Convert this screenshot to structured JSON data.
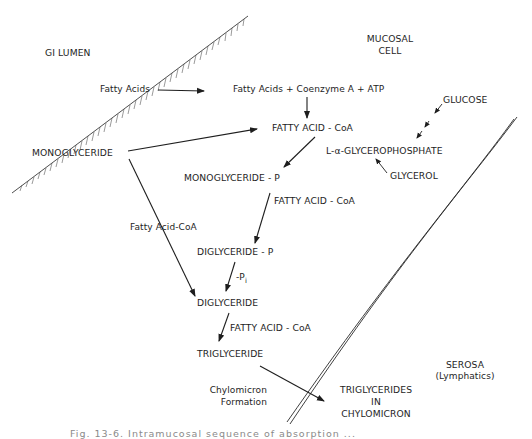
{
  "regions": {
    "gi_lumen": "GI   LUMEN",
    "mucosal_cell": [
      "MUCOSAL",
      "CELL"
    ],
    "serosa": [
      "SEROSA",
      "(Lymphatics)"
    ]
  },
  "nodes": {
    "fatty_acids_lumen": "Fatty Acids",
    "monoglyceride_lumen": "MONOGLYCERIDE",
    "activation": "Fatty Acids  +  Coenzyme A  +  ATP",
    "fatty_acid_coa_1": "FATTY ACID - CoA",
    "glucose": "GLUCOSE",
    "glycerophosphate": "L-α-GLYCEROPHOSPHATE",
    "glycerol": "GLYCEROL",
    "monoglyceride_p": "MONOGLYCERIDE - P",
    "fatty_acid_coa_2": "FATTY ACID - CoA",
    "fatty_acid_coa_side": "Fatty Acid-CoA",
    "diglyceride_p": "DIGLYCERIDE - P",
    "minus_pi": "-P",
    "minus_pi_sub": "i",
    "diglyceride": "DIGLYCERIDE",
    "fatty_acid_coa_3": "FATTY ACID - CoA",
    "triglyceride": "TRIGLYCERIDE",
    "chylomicron_formation": [
      "Chylomicron",
      "Formation"
    ],
    "triglycerides_in_chylomicron": [
      "TRIGLYCERIDES",
      "IN",
      "CHYLOMICRON"
    ]
  },
  "edges": [
    {
      "from": "fatty_acids_lumen",
      "to": "activation"
    },
    {
      "from": "activation",
      "to": "fatty_acid_coa_1"
    },
    {
      "from": "monoglyceride_lumen",
      "to": "fatty_acid_coa_1"
    },
    {
      "from": "fatty_acid_coa_1",
      "to": "monoglyceride_p"
    },
    {
      "from": "glucose",
      "to": "glycerophosphate",
      "style": "dashed"
    },
    {
      "from": "glycerol",
      "to": "glycerophosphate"
    },
    {
      "from": "monoglyceride_p",
      "to": "diglyceride_p",
      "label": "FATTY ACID - CoA"
    },
    {
      "from": "monoglyceride_lumen",
      "to": "diglyceride",
      "label": "Fatty Acid-CoA"
    },
    {
      "from": "diglyceride_p",
      "to": "diglyceride",
      "label": "-Pi"
    },
    {
      "from": "diglyceride",
      "to": "triglyceride",
      "label": "FATTY ACID - CoA"
    },
    {
      "from": "triglyceride",
      "to": "triglycerides_in_chylomicron",
      "label": "Chylomicron Formation"
    }
  ],
  "caption": "Fig. 13-6.  Intramucosal sequence of absorption ..."
}
